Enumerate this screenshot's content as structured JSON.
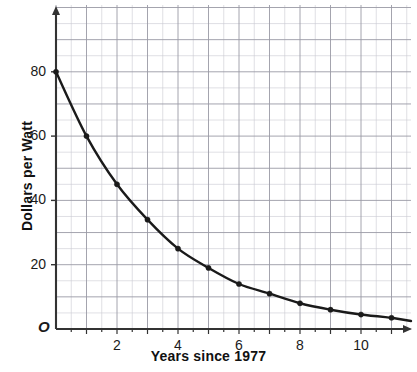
{
  "chart_data": {
    "type": "line",
    "title": "",
    "subtitle": "",
    "xlabel": "Years since 1977",
    "ylabel": "Dollars per Watt",
    "xlim": [
      0,
      11.6
    ],
    "ylim": [
      0,
      96
    ],
    "grid": true,
    "grid_major_x": 1,
    "grid_minor_x": 0.5,
    "grid_major_y": 10,
    "grid_minor_y": 5,
    "legend": "none",
    "x_tick_labels": [
      "2",
      "4",
      "6",
      "8",
      "10"
    ],
    "x_tick_values": [
      2,
      4,
      6,
      8,
      10
    ],
    "y_tick_labels": [
      "20",
      "40",
      "60",
      "80"
    ],
    "y_tick_values": [
      20,
      40,
      60,
      80
    ],
    "origin_label": "O",
    "series": [
      {
        "name": "Cost of solar power",
        "color": "#1a1a1a",
        "marker": "dot",
        "x": [
          0,
          1,
          2,
          3,
          4,
          5,
          6,
          7,
          8,
          9,
          10,
          11
        ],
        "values": [
          80,
          60,
          45,
          34,
          25,
          19,
          14,
          11,
          8,
          6,
          4.5,
          3.5
        ]
      }
    ],
    "annotations": []
  },
  "axes": {
    "x_title": "Years since 1977",
    "y_title": "Dollars per Watt",
    "origin": "O"
  },
  "colors": {
    "curve": "#1a1a1a",
    "axis": "#333333",
    "grid_major": "#9a9aa5",
    "grid_minor": "#c9c9d2",
    "background": "#ffffff",
    "text": "#1a1a1a"
  }
}
